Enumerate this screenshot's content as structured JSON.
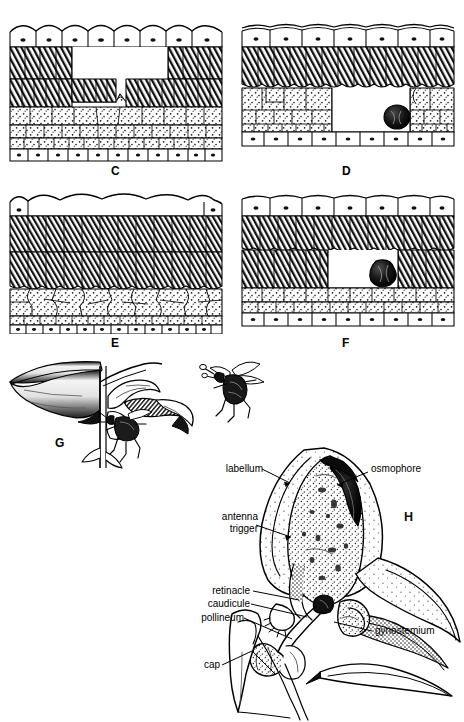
{
  "figure": {
    "cropped_caption": "morphology of the osmophore and pollination",
    "panels": [
      {
        "id": "C",
        "letter": "C",
        "type": "tissue-section",
        "description": "leaf cross-section with large central cavity, upper epidermis intact"
      },
      {
        "id": "D",
        "letter": "D",
        "type": "tissue-section",
        "description": "leaf cross-section with cavity and dark secretory body at right margin"
      },
      {
        "id": "E",
        "letter": "E",
        "type": "tissue-section",
        "description": "intact leaf cross-section, no cavity, dense palisade mesophyll"
      },
      {
        "id": "F",
        "letter": "F",
        "type": "tissue-section",
        "description": "leaf cross-section with cavity and dark secretory body"
      },
      {
        "id": "G",
        "letter": "G",
        "type": "flower-with-pollinator",
        "description": "orchid flower in profile with bee entering, and bee in flight carrying pollinarium"
      },
      {
        "id": "H",
        "letter": "H",
        "type": "labeled-flower-anatomy",
        "description": "longitudinal section of orchid flower showing labellum, osmophore and gynostemium"
      }
    ]
  },
  "panel_h": {
    "letter": "H",
    "labels": [
      {
        "key": "labellum",
        "text": "labellum",
        "align": "right"
      },
      {
        "key": "osmophore",
        "text": "osmophore",
        "align": "left"
      },
      {
        "key": "antenna",
        "text": "antenna\ntrigger",
        "line1": "antenna",
        "line2": "trigger",
        "align": "right"
      },
      {
        "key": "retinacle",
        "text": "retinacle",
        "align": "right"
      },
      {
        "key": "caudicule",
        "text": "caudicule",
        "align": "right"
      },
      {
        "key": "pollineum",
        "text": "pollineum",
        "align": "right"
      },
      {
        "key": "cap",
        "text": "cap",
        "align": "right"
      },
      {
        "key": "gynostemium",
        "text": "gynostemium",
        "align": "left"
      }
    ]
  },
  "colors": {
    "ink": "#000000",
    "paper": "#ffffff",
    "mid_gray": "#7a7a7a",
    "light_gray": "#c9c9c9"
  }
}
